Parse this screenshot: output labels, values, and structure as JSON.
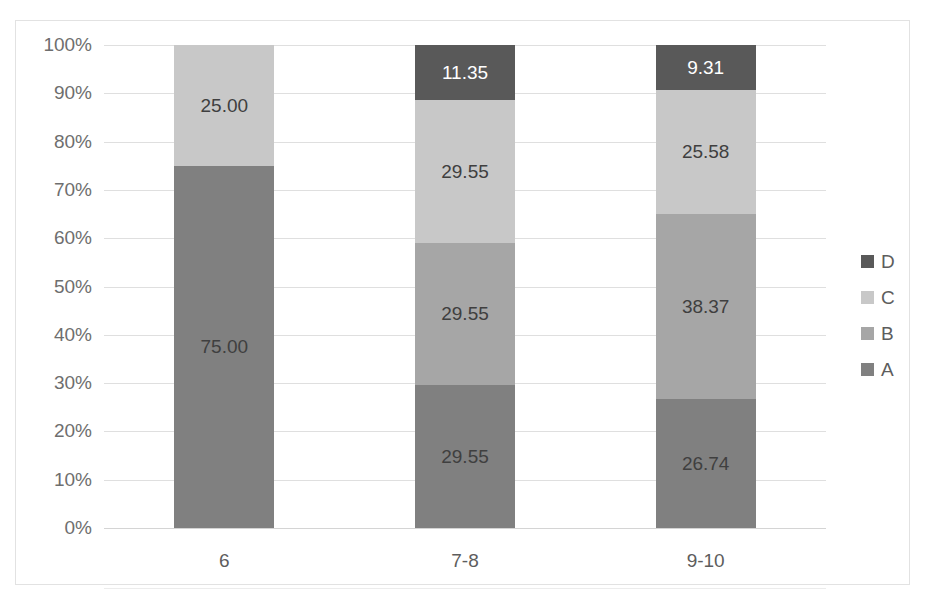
{
  "chart_data": {
    "type": "bar",
    "stacked": true,
    "stack_mode": "percent",
    "title": "",
    "xlabel": "",
    "ylabel": "",
    "categories": [
      "6",
      "7-8",
      "9-10"
    ],
    "series": [
      {
        "name": "A",
        "color": "#808080",
        "values": [
          75.0,
          29.55,
          26.74
        ],
        "label_color": "#3f3f3f"
      },
      {
        "name": "B",
        "color": "#a6a6a6",
        "values": [
          0,
          29.55,
          38.37
        ],
        "label_color": "#3f3f3f"
      },
      {
        "name": "C",
        "color": "#c8c8c8",
        "values": [
          25.0,
          29.55,
          25.58
        ],
        "label_color": "#3f3f3f"
      },
      {
        "name": "D",
        "color": "#595959",
        "values": [
          0,
          11.35,
          9.31
        ],
        "label_color": "#ffffff"
      }
    ],
    "data_labels": [
      [
        "75.00",
        "",
        "25.00",
        ""
      ],
      [
        "29.55",
        "29.55",
        "29.55",
        "11.35"
      ],
      [
        "26.74",
        "38.37",
        "25.58",
        "9.31"
      ]
    ],
    "ylim": [
      0,
      100
    ],
    "yticks": [
      "0%",
      "10%",
      "20%",
      "30%",
      "40%",
      "50%",
      "60%",
      "70%",
      "80%",
      "90%",
      "100%"
    ],
    "ytick_values": [
      0,
      10,
      20,
      30,
      40,
      50,
      60,
      70,
      80,
      90,
      100
    ],
    "grid": true,
    "legend_position": "right",
    "legend_order": [
      "D",
      "C",
      "B",
      "A"
    ],
    "plot_background": "#ffffff",
    "gridline_color": "#dfdfdf",
    "border_color": "#e2e2e2",
    "axis_text_color": "#6e6e6e"
  }
}
